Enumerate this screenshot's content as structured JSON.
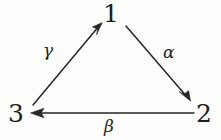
{
  "figure": {
    "kind": "directed-triangle-diagram",
    "background_color": "#fdfdfc",
    "stroke_color": "#262626",
    "text_color": "#1d1d1d",
    "width": 221,
    "height": 140
  },
  "nodes": [
    {
      "id": "1",
      "label": "1",
      "x": 112,
      "y": 13
    },
    {
      "id": "2",
      "label": "2",
      "x": 204,
      "y": 113
    },
    {
      "id": "3",
      "label": "3",
      "x": 17,
      "y": 113
    }
  ],
  "edges": [
    {
      "id": "alpha",
      "label": "α",
      "from": "1",
      "to": "2",
      "start": {
        "x": 126,
        "y": 26
      },
      "end": {
        "x": 190,
        "y": 101
      },
      "label_pos": {
        "x": 171,
        "y": 52
      }
    },
    {
      "id": "beta",
      "label": "β",
      "from": "2",
      "to": "3",
      "start": {
        "x": 194,
        "y": 113
      },
      "end": {
        "x": 31,
        "y": 113
      },
      "label_pos": {
        "x": 111,
        "y": 127
      }
    },
    {
      "id": "gamma",
      "label": "γ",
      "from": "3",
      "to": "1",
      "start": {
        "x": 33,
        "y": 105
      },
      "end": {
        "x": 101,
        "y": 24
      },
      "label_pos": {
        "x": 50,
        "y": 50
      }
    }
  ]
}
